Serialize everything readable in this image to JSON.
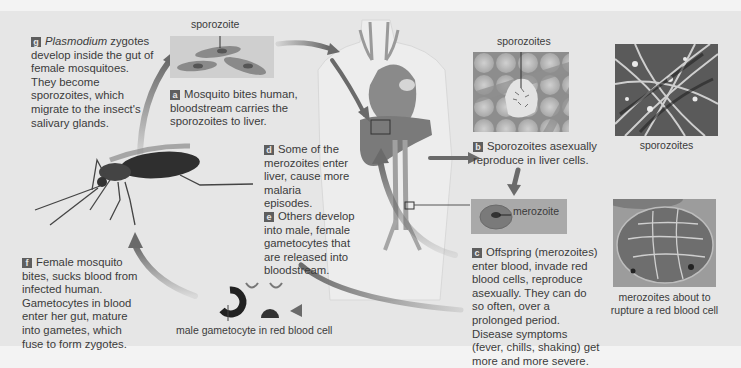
{
  "diagram": {
    "steps": {
      "a": {
        "letter": "a",
        "text": "Mosquito bites human, bloodstream carries the sporozoites to liver."
      },
      "b": {
        "letter": "b",
        "text": "Sporozoites asexually reproduce in liver cells."
      },
      "c": {
        "letter": "c",
        "text": "Offspring (merozoites) enter blood, invade red blood cells, reproduce asexually. They can do so often, over a prolonged period. Disease symptoms (fever, chills, shaking) get more and more severe."
      },
      "d": {
        "letter": "d",
        "text": "Some of the merozoites enter liver, cause more malaria episodes."
      },
      "e": {
        "letter": "e",
        "text": "Others develop into male, female gametocytes that are released into bloodstream."
      },
      "f": {
        "letter": "f",
        "text": "Female mosquito bites, sucks blood from infected human. Gametocytes in blood enter her gut, mature into gametes, which fuse to form zygotes."
      },
      "g": {
        "letter": "g",
        "italic": "Plasmodium",
        "text": " zygotes develop inside the gut of female mosquitoes. They become sporozoites, which migrate to the insect's salivary glands."
      }
    },
    "labels": {
      "sporozoite": "sporozoite",
      "sporozoites_liver": "sporozoites",
      "merozoite": "merozoite",
      "male_gametocyte": "male gametocyte in red blood cell"
    },
    "captions": {
      "micrograph_sporozoites": "sporozoites",
      "micrograph_merozoites": "merozoites about to rupture a red blood cell"
    },
    "colors": {
      "panel_bg": "#e6e6e6",
      "page_bg": "#f3f3f3",
      "arrow": "#6a6a6a",
      "badge": "#5e5e5e",
      "text": "#3b3b3b"
    }
  }
}
